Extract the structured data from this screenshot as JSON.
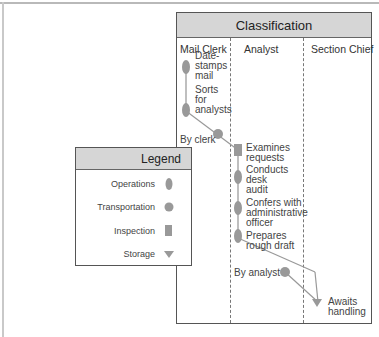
{
  "diagram": {
    "title": "Classification",
    "columns": [
      {
        "label": "Mail Clerk"
      },
      {
        "label": "Analyst"
      },
      {
        "label": "Section Chief"
      }
    ],
    "steps": [
      {
        "type": "operation",
        "lines": [
          "Date-",
          "stamps",
          "mail"
        ],
        "lane": "Mail Clerk"
      },
      {
        "type": "operation",
        "lines": [
          "Sorts",
          "for",
          "analysts"
        ],
        "lane": "Mail Clerk"
      },
      {
        "type": "transportation",
        "lines": [
          "By clerk"
        ],
        "lane": "Mail Clerk"
      },
      {
        "type": "inspection",
        "lines": [
          "Examines",
          "requests"
        ],
        "lane": "Analyst"
      },
      {
        "type": "operation",
        "lines": [
          "Conducts",
          "desk",
          "audit"
        ],
        "lane": "Analyst"
      },
      {
        "type": "operation",
        "lines": [
          "Confers with",
          "administrative",
          "officer"
        ],
        "lane": "Analyst"
      },
      {
        "type": "operation",
        "lines": [
          "Prepares",
          "rough draft"
        ],
        "lane": "Analyst"
      },
      {
        "type": "transportation",
        "lines": [
          "By analyst"
        ],
        "lane": "Analyst"
      },
      {
        "type": "storage",
        "lines": [
          "Awaits",
          "handling"
        ],
        "lane": "Section Chief"
      }
    ],
    "legend": {
      "title": "Legend",
      "items": [
        {
          "label": "Operations",
          "symbol": "ellipse"
        },
        {
          "label": "Transportation",
          "symbol": "circle"
        },
        {
          "label": "Inspection",
          "symbol": "square"
        },
        {
          "label": "Storage",
          "symbol": "triangle-down"
        }
      ]
    },
    "colors": {
      "symbol": "#999999",
      "header": "#d6d6d6",
      "border": "#555555"
    }
  }
}
